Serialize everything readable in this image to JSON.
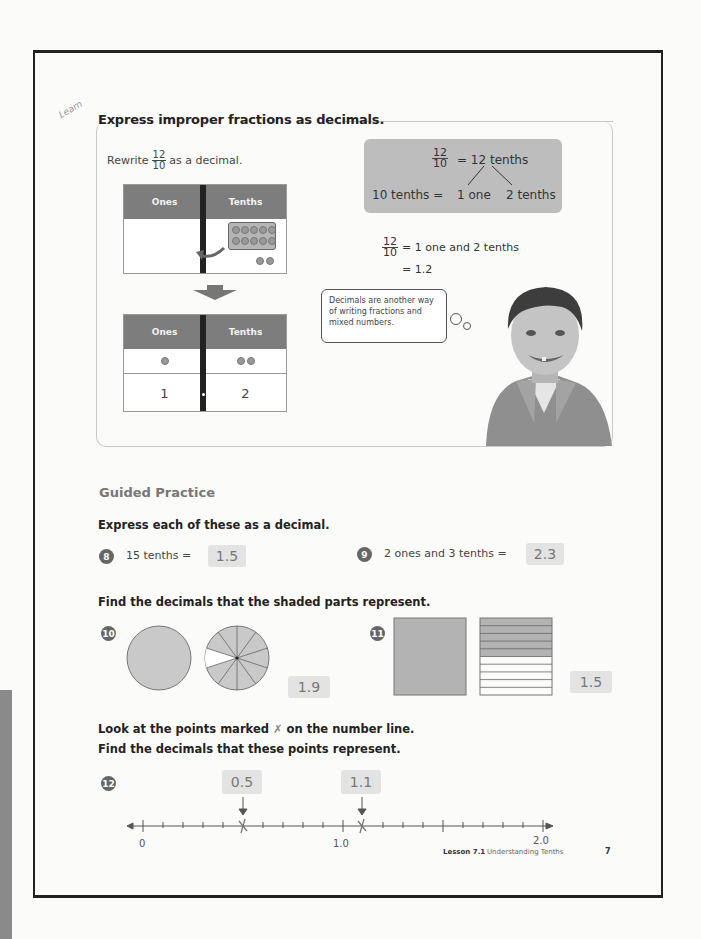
{
  "learn": {
    "tag": "Learn",
    "title": "Express improper fractions as decimals.",
    "rewrite_prefix": "Rewrite",
    "rewrite_fraction": {
      "numerator": "12",
      "denominator": "10"
    },
    "rewrite_suffix": "as a decimal.",
    "table_top": {
      "headers": [
        "Ones",
        "Tenths"
      ],
      "tenths_counters": 10,
      "extra_counters": 2
    },
    "table_bottom": {
      "headers": [
        "Ones",
        "Tenths"
      ],
      "counters": [
        1,
        2
      ],
      "digits": [
        "1",
        "2"
      ]
    },
    "gray_box": {
      "fraction": {
        "numerator": "12",
        "denominator": "10"
      },
      "line1_rhs": "=  12 tenths",
      "line2_left": "10 tenths =",
      "line2_mid": "1 one",
      "line2_right": "2 tenths"
    },
    "equation": {
      "fraction": {
        "numerator": "12",
        "denominator": "10"
      },
      "line1": "=  1 one and 2 tenths",
      "line2": "=  1.2"
    },
    "thought_bubble": "Decimals are another way of writing fractions and mixed numbers."
  },
  "guided": {
    "title": "Guided Practice",
    "instruction1": "Express each of these as a decimal.",
    "q8": {
      "number": "8",
      "text": "15 tenths  =",
      "answer": "1.5"
    },
    "q9": {
      "number": "9",
      "text": "2 ones and 3 tenths  =",
      "answer": "2.3"
    },
    "instruction2": "Find the decimals that the shaded parts represent.",
    "q10": {
      "number": "10",
      "answer": "1.9",
      "description": "One fully shaded circle and a circle with 9 of 10 parts shaded"
    },
    "q11": {
      "number": "11",
      "answer": "1.5",
      "description": "One fully shaded square and a square with 5 of 10 strips shaded"
    },
    "instruction3a": "Look at the points marked",
    "instruction3_mark": "✗",
    "instruction3b": "on the number line.",
    "instruction4": "Find the decimals that these points represent.",
    "q12": {
      "number": "12",
      "answers": [
        "0.5",
        "1.1"
      ],
      "number_line": {
        "start": "0",
        "mid": "1.0",
        "end": "2.0",
        "marks": [
          0.5,
          1.1
        ]
      }
    }
  },
  "footer": {
    "lesson": "Lesson 7.1",
    "title": "Understanding Tenths",
    "page": "7"
  }
}
